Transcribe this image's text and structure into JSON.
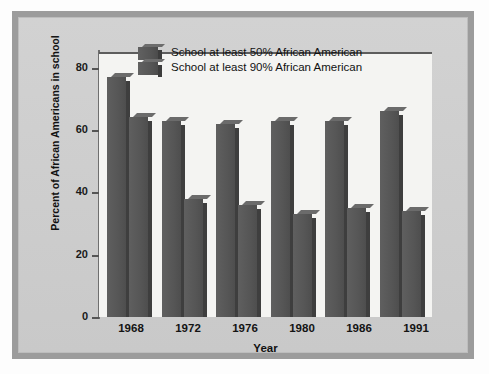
{
  "figure": {
    "frame_color": "#9c9c9c",
    "canvas_color": "#cfcfcf",
    "plot_background": "#f4f4f2",
    "bar_color": "#565656"
  },
  "chart_data": {
    "type": "bar",
    "title": "",
    "subtitle": "",
    "xlabel": "Year",
    "ylabel": "Percent of African Americans in school",
    "categories": [
      "1968",
      "1972",
      "1976",
      "1980",
      "1986",
      "1991"
    ],
    "ylim": [
      0,
      85
    ],
    "yticks": [
      0,
      20,
      40,
      60,
      80
    ],
    "ytick_labels": [
      "0",
      "20",
      "40",
      "60",
      "80"
    ],
    "grid": false,
    "legend_position": "top-center",
    "series": [
      {
        "name": "School at least 50% African American",
        "values": [
          77,
          63,
          62,
          63,
          63,
          66
        ]
      },
      {
        "name": "School at least 90% African American",
        "values": [
          64,
          38,
          36,
          33,
          35,
          34
        ]
      }
    ]
  }
}
